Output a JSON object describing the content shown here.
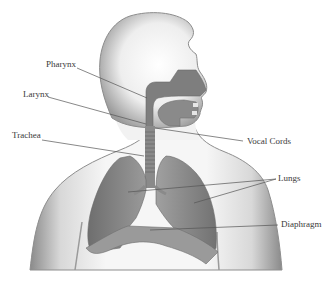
{
  "diagram": {
    "colors": {
      "body_fill": "#ececec",
      "body_shade": "#9a9a9a",
      "organ_dark": "#7a7a7a",
      "organ_mid": "#8c8c8c",
      "organ_light": "#a8a8a8",
      "leader_line": "#555555",
      "label_text": "#3a3a3a"
    },
    "labels": {
      "pharynx": "Pharynx",
      "larynx": "Larynx",
      "trachea": "Trachea",
      "vocal_cords": "Vocal Cords",
      "lungs": "Lungs",
      "diaphragm": "Diaphragm"
    }
  }
}
